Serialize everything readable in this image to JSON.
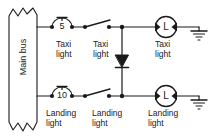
{
  "diagram": {
    "bus": {
      "label": "Main bus"
    },
    "colors": {
      "line": "#1a1a1a",
      "text": "#1a1a1a",
      "background": "#ffffff"
    },
    "fuses": [
      {
        "id": "fuse-taxi",
        "rating": "5"
      },
      {
        "id": "fuse-landing",
        "rating": "10"
      }
    ],
    "labels": {
      "taxi_1": {
        "line1": "Taxi",
        "line2": "light"
      },
      "taxi_2": {
        "line1": "Taxi",
        "line2": "light"
      },
      "taxi_3": {
        "line1": "Taxi",
        "line2": "light"
      },
      "landing_1": {
        "line1": "Landing",
        "line2": "light"
      },
      "landing_2": {
        "line1": "Landing",
        "line2": "light"
      },
      "landing_3": {
        "line1": "Landing",
        "line2": "light"
      }
    },
    "lamps": [
      {
        "id": "lamp-taxi",
        "glyph": "L"
      },
      {
        "id": "lamp-landing",
        "glyph": "L"
      }
    ]
  }
}
